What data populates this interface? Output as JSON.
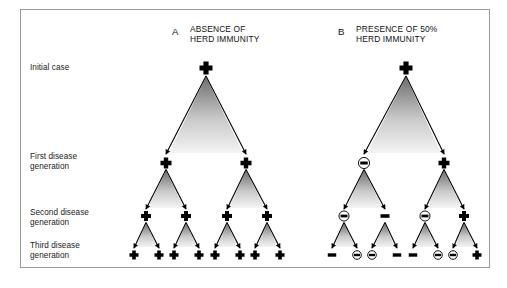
{
  "figure": {
    "background_color": "#ffffff",
    "border_color": "#9a9a9a",
    "symbol_color": "#000000",
    "triangle_gradient": [
      "#6e6e6e",
      "#f2f2f2"
    ]
  },
  "row_labels": [
    {
      "id": "initial-case",
      "text": "Initial case",
      "x": 30,
      "y": 63
    },
    {
      "id": "first-generation",
      "text": "First disease\ngeneration",
      "x": 30,
      "y": 152
    },
    {
      "id": "second-generation",
      "text": "Second disease\ngeneration",
      "x": 30,
      "y": 208
    },
    {
      "id": "third-generation",
      "text": "Third disease\ngeneration",
      "x": 30,
      "y": 241
    }
  ],
  "panels": [
    {
      "id": "panel-a",
      "letter": "A",
      "letter_x": 172,
      "letter_y": 26,
      "title": "ABSENCE OF\nHERD IMMUNITY",
      "title_x": 190,
      "title_y": 24,
      "generations": [
        {
          "id": "initial",
          "y": 68,
          "nodes": [
            {
              "x": 206,
              "type": "plus"
            }
          ]
        },
        {
          "id": "first",
          "y": 163,
          "nodes": [
            {
              "x": 166,
              "type": "plus"
            },
            {
              "x": 246,
              "type": "plus"
            }
          ]
        },
        {
          "id": "second",
          "y": 216,
          "nodes": [
            {
              "x": 146,
              "type": "plus"
            },
            {
              "x": 186,
              "type": "plus"
            },
            {
              "x": 227,
              "type": "plus"
            },
            {
              "x": 267,
              "type": "plus"
            }
          ]
        },
        {
          "id": "third",
          "y": 255,
          "nodes": [
            {
              "x": 134,
              "type": "plus"
            },
            {
              "x": 159,
              "type": "plus"
            },
            {
              "x": 174,
              "type": "plus"
            },
            {
              "x": 199,
              "type": "plus"
            },
            {
              "x": 215,
              "type": "plus"
            },
            {
              "x": 240,
              "type": "plus"
            },
            {
              "x": 255,
              "type": "plus"
            },
            {
              "x": 280,
              "type": "plus"
            }
          ]
        }
      ]
    },
    {
      "id": "panel-b",
      "letter": "B",
      "letter_x": 338,
      "letter_y": 26,
      "title": "PRESENCE OF 50%\nHERD IMMUNITY",
      "title_x": 356,
      "title_y": 24,
      "generations": [
        {
          "id": "initial",
          "y": 68,
          "nodes": [
            {
              "x": 406,
              "type": "plus"
            }
          ]
        },
        {
          "id": "first",
          "y": 163,
          "nodes": [
            {
              "x": 364,
              "type": "circled-minus"
            },
            {
              "x": 444,
              "type": "plus"
            }
          ]
        },
        {
          "id": "second",
          "y": 216,
          "nodes": [
            {
              "x": 344,
              "type": "circled-minus"
            },
            {
              "x": 385,
              "type": "minus"
            },
            {
              "x": 425,
              "type": "circled-minus"
            },
            {
              "x": 464,
              "type": "plus"
            }
          ]
        },
        {
          "id": "third",
          "y": 255,
          "nodes": [
            {
              "x": 332,
              "type": "minus"
            },
            {
              "x": 357,
              "type": "circled-minus"
            },
            {
              "x": 372,
              "type": "circled-minus"
            },
            {
              "x": 397,
              "type": "minus"
            },
            {
              "x": 413,
              "type": "minus"
            },
            {
              "x": 438,
              "type": "circled-minus"
            },
            {
              "x": 453,
              "type": "circled-minus"
            },
            {
              "x": 477,
              "type": "plus"
            }
          ]
        }
      ]
    }
  ],
  "legend_note": {
    "plus": "infected case",
    "minus": "immune / uninfected case",
    "circled-minus": "immune case blocking transmission"
  }
}
